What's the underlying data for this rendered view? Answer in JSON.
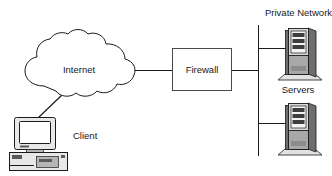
{
  "diagram": {
    "background_color": "#ffffff",
    "line_color": "#1a1a1a",
    "nodes": {
      "internet": {
        "label": "Internet",
        "icon": "cloud-icon",
        "shape": "cloud"
      },
      "firewall": {
        "label": "Firewall",
        "icon": "rectangle-box-icon",
        "shape": "rectangle"
      },
      "client": {
        "label": "Client",
        "icon": "desktop-computer-icon",
        "shape": "computer"
      },
      "servers": {
        "label": "Servers",
        "icon": "server-tower-icon",
        "count": 2,
        "shape": "tower"
      },
      "private_network": {
        "label": "Private Network",
        "icon": "bus-line-icon",
        "shape": "vertical-bus"
      }
    },
    "connections": [
      {
        "from": "client",
        "to": "internet",
        "style": "diagonal"
      },
      {
        "from": "internet",
        "to": "firewall",
        "style": "horizontal"
      },
      {
        "from": "firewall",
        "to": "private_network",
        "style": "horizontal"
      },
      {
        "from": "private_network",
        "to": "server-1",
        "style": "horizontal"
      },
      {
        "from": "private_network",
        "to": "server-2",
        "style": "horizontal"
      }
    ]
  }
}
